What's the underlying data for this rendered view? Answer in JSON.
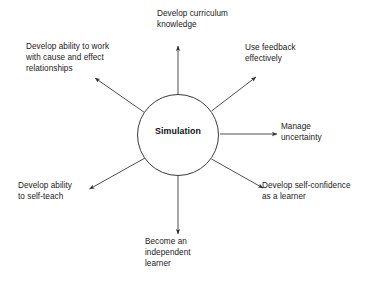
{
  "diagram": {
    "type": "radial-spoke",
    "center": {
      "label": "Simulation",
      "shape": "circle"
    },
    "nodes": [
      {
        "id": "curriculum-knowledge",
        "label": "Develop curriculum\nknowledge",
        "direction": "top"
      },
      {
        "id": "cause-and-effect",
        "label": "Develop ability to work\nwith cause and effect\nrelationships",
        "direction": "upper-left"
      },
      {
        "id": "use-feedback",
        "label": "Use feedback\neffectively",
        "direction": "upper-right"
      },
      {
        "id": "manage-uncertainty",
        "label": "Manage\nuncertainty",
        "direction": "right"
      },
      {
        "id": "self-confidence",
        "label": "Develop self-confidence\nas a learner",
        "direction": "lower-right"
      },
      {
        "id": "independent-learner",
        "label": "Become an\nindependent\nlearner",
        "direction": "bottom"
      },
      {
        "id": "self-teach",
        "label": "Develop ability\nto self-teach",
        "direction": "lower-left"
      }
    ],
    "colors": {
      "background": "#ffffff",
      "stroke": "#3a3a3a",
      "text": "#1a1a1a",
      "center_text": "#111111"
    }
  }
}
